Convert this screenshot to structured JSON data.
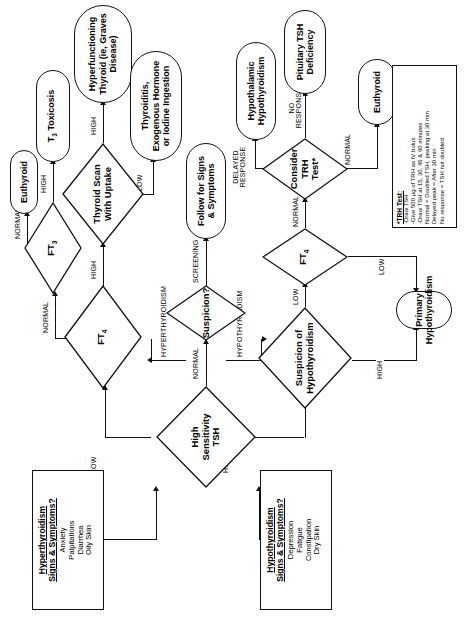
{
  "diagram": {
    "type": "clinical-flowchart",
    "orientation": "rotated-90-ccw"
  },
  "nodes": {
    "hyper_symptoms": {
      "title": "Hyperthyroidism\nSigns & Symptoms?",
      "title_line1": "Hyperthyroidism",
      "title_line2": "Signs & Symptoms?",
      "items": [
        "Anxiety",
        "Palpitations",
        "Diarrhea",
        "Oily Skin"
      ]
    },
    "hypo_symptoms": {
      "title_line1": "Hypothyroidism",
      "title_line2": "Signs & Symptoms?",
      "items": [
        "Depression",
        "Fatigue",
        "Constipation",
        "Dry Skin"
      ]
    },
    "tsh": {
      "label": "High\nSensitivity\nTSH",
      "l1": "High",
      "l2": "Sensitivity",
      "l3": "TSH"
    },
    "suspicion": {
      "label": "Suspicion?"
    },
    "ft4_upper": {
      "label": "FT",
      "sub": "4"
    },
    "ft3": {
      "label": "FT",
      "sub": "3"
    },
    "scan": {
      "l1": "Thyroid Scan",
      "l2": "With Uptake"
    },
    "suspicion_hypo": {
      "l1": "Suspicion of",
      "l2": "Hypothyroidism"
    },
    "ft4_lower": {
      "label": "FT",
      "sub": "4"
    },
    "trh": {
      "l1": "Consider",
      "l2": "TRH",
      "l3": "Test*"
    },
    "euthyroid_top": {
      "label": "Euthyroid"
    },
    "t3_toxicosis": {
      "l1": "T",
      "sub": "3",
      "l2": " Toxicosis"
    },
    "hyperfunctioning": {
      "l1": "Hyperfunctioning",
      "l2": "Thyroid (ie, Graves",
      "l3": "Disease)"
    },
    "thyroiditis": {
      "l1": "Thyroiditis,",
      "l2": "Exogenous Hormone",
      "l3": "or Iodine Ingestion"
    },
    "follow": {
      "l1": "Follow for Signs",
      "l2": "& Symptoms"
    },
    "hypothalamic": {
      "l1": "Hypothalamic",
      "l2": "Hypothyroidism"
    },
    "pituitary": {
      "l1": "Pituitary TSH",
      "l2": "Deficiency"
    },
    "primary_hypo": {
      "l1": "Primary",
      "l2": "Hypothyroidism"
    },
    "euthyroid_bottom": {
      "label": "Euthyroid"
    }
  },
  "note": {
    "title": "*TRH Test:",
    "lines": [
      "-Draw TSH",
      "-Give 500 µg of TRH as IV bolus",
      "-Draw TSH at 15, 30, 45 & 60 minutes",
      "Normal = Doubled TSH, peaking at 30 min",
      "Delayed peak = After 30 min",
      "No response = TSH not doubled"
    ]
  },
  "edges": {
    "low": "LOW",
    "normal": "NORMAL",
    "high": "HIGH",
    "hyperthyroidism": "HYPERTHYROIDISM",
    "hypothyroidism": "HYPOTHYROIDISM",
    "screening": "SCREENING",
    "delayed_response_l1": "DELAYED",
    "delayed_response_l2": "RESPONSE",
    "no_response_l1": "NO",
    "no_response_l2": "RESPONSE"
  },
  "colors": {
    "stroke": "#111111",
    "background": "#ffffff",
    "text": "#000000"
  }
}
